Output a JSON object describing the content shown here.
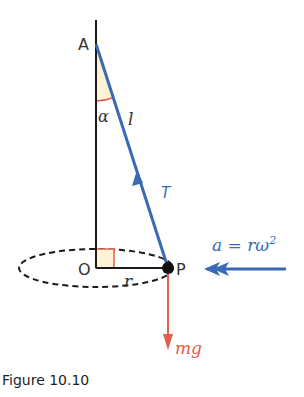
{
  "figure": {
    "caption": "Figure 10.10",
    "points": {
      "A": "A",
      "O": "O",
      "P": "P"
    },
    "labels": {
      "angle": "α",
      "length": "l",
      "radius": "r",
      "tension": "T",
      "weight": "mg",
      "acceleration": "a = rω",
      "acceleration_exp": "2"
    },
    "colors": {
      "structure": "#1a1a1a",
      "tension_blue": "#3a6ab4",
      "weight_red": "#e0604a",
      "angle_fill": "#fdf1d6",
      "right_angle_red": "#e0604a"
    }
  }
}
